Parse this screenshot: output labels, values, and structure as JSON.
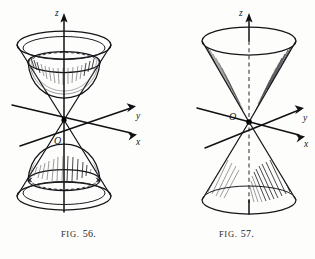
{
  "page": {
    "background_color": "#fdfdfc",
    "ink_color": "#141418",
    "width": 315,
    "height": 259
  },
  "figures": [
    {
      "id": "fig-56",
      "caption_prefix": "Fig.",
      "caption_number": "56.",
      "caption_full": "Fig. 56.",
      "subject": "two-sheeted hyperboloid with asymptotic cone",
      "axes": {
        "z_label": "z",
        "y_label": "y",
        "x_label": "x",
        "origin_label": "O"
      }
    },
    {
      "id": "fig-57",
      "caption_prefix": "Fig.",
      "caption_number": "57.",
      "caption_full": "Fig. 57.",
      "subject": "double right circular cone",
      "axes": {
        "z_label": "z",
        "y_label": "y",
        "x_label": "x",
        "origin_label": "O"
      }
    }
  ]
}
